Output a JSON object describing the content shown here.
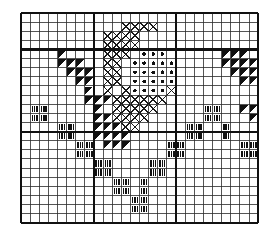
{
  "chart_data": {
    "type": "heatmap",
    "title": "",
    "subtitle": "",
    "xlabel": "",
    "ylabel": "",
    "grid": {
      "columns": 26,
      "rows": 23,
      "cell_size": 9.12,
      "origin_x": 21,
      "origin_y": 13,
      "line_color": "#2b2b2b",
      "line_width": 0.8,
      "heavy_line_width": 2.1,
      "heavy_line_color": "#111111",
      "heavy_columns": [
        0,
        8,
        17,
        26
      ],
      "heavy_rows": [
        0,
        4,
        13,
        23
      ],
      "grid_on": true
    },
    "legend_position": "none",
    "symbols": [
      {
        "key": "triangle",
        "name": "filled-triangle",
        "color": "#111111",
        "label": "half-stitch (solid)"
      },
      {
        "key": "dot",
        "name": "filled-dot",
        "color": "#111111",
        "label": "french knot / bead"
      },
      {
        "key": "cross",
        "name": "cross-stitch-x",
        "color": "#1a1a1a",
        "label": "cross stitch"
      },
      {
        "key": "bars",
        "name": "triple-vertical-bars",
        "color": "#111111",
        "label": "straight stitch"
      }
    ],
    "categories": [
      "c0",
      "c1",
      "c2",
      "c3",
      "c4",
      "c5",
      "c6",
      "c7",
      "c8",
      "c9",
      "c10",
      "c11",
      "c12",
      "c13",
      "c14",
      "c15",
      "c16",
      "c17",
      "c18",
      "c19",
      "c20",
      "c21",
      "c22",
      "c23",
      "c24",
      "c25"
    ],
    "row_labels": [
      "r0",
      "r1",
      "r2",
      "r3",
      "r4",
      "r5",
      "r6",
      "r7",
      "r8",
      "r9",
      "r10",
      "r11",
      "r12",
      "r13",
      "r14",
      "r15",
      "r16",
      "r17",
      "r18",
      "r19",
      "r20",
      "r21",
      "r22"
    ],
    "cells": [
      {
        "col": 11,
        "row": 1,
        "sym": "cross"
      },
      {
        "col": 12,
        "row": 1,
        "sym": "cross"
      },
      {
        "col": 13,
        "row": 1,
        "sym": "cross"
      },
      {
        "col": 14,
        "row": 1,
        "sym": "cross"
      },
      {
        "col": 9,
        "row": 2,
        "sym": "cross"
      },
      {
        "col": 10,
        "row": 2,
        "sym": "cross"
      },
      {
        "col": 11,
        "row": 2,
        "sym": "cross"
      },
      {
        "col": 12,
        "row": 2,
        "sym": "cross"
      },
      {
        "col": 9,
        "row": 3,
        "sym": "cross"
      },
      {
        "col": 10,
        "row": 3,
        "sym": "cross"
      },
      {
        "col": 11,
        "row": 3,
        "sym": "cross"
      },
      {
        "col": 12,
        "row": 3,
        "sym": "cross"
      },
      {
        "col": 4,
        "row": 4,
        "sym": "triangle"
      },
      {
        "col": 9,
        "row": 4,
        "sym": "cross"
      },
      {
        "col": 10,
        "row": 4,
        "sym": "cross"
      },
      {
        "col": 11,
        "row": 4,
        "sym": "cross"
      },
      {
        "col": 13,
        "row": 4,
        "sym": "dot"
      },
      {
        "col": 14,
        "row": 4,
        "sym": "dot"
      },
      {
        "col": 15,
        "row": 4,
        "sym": "dot"
      },
      {
        "col": 22,
        "row": 4,
        "sym": "triangle"
      },
      {
        "col": 23,
        "row": 4,
        "sym": "triangle"
      },
      {
        "col": 24,
        "row": 4,
        "sym": "triangle"
      },
      {
        "col": 4,
        "row": 5,
        "sym": "triangle"
      },
      {
        "col": 5,
        "row": 5,
        "sym": "triangle"
      },
      {
        "col": 6,
        "row": 5,
        "sym": "triangle"
      },
      {
        "col": 9,
        "row": 5,
        "sym": "cross"
      },
      {
        "col": 10,
        "row": 5,
        "sym": "cross"
      },
      {
        "col": 12,
        "row": 5,
        "sym": "dot"
      },
      {
        "col": 13,
        "row": 5,
        "sym": "dot"
      },
      {
        "col": 14,
        "row": 5,
        "sym": "dot"
      },
      {
        "col": 15,
        "row": 5,
        "sym": "dot"
      },
      {
        "col": 16,
        "row": 5,
        "sym": "dot"
      },
      {
        "col": 22,
        "row": 5,
        "sym": "triangle"
      },
      {
        "col": 23,
        "row": 5,
        "sym": "triangle"
      },
      {
        "col": 24,
        "row": 5,
        "sym": "triangle"
      },
      {
        "col": 25,
        "row": 5,
        "sym": "triangle"
      },
      {
        "col": 5,
        "row": 6,
        "sym": "triangle"
      },
      {
        "col": 6,
        "row": 6,
        "sym": "triangle"
      },
      {
        "col": 7,
        "row": 6,
        "sym": "triangle"
      },
      {
        "col": 9,
        "row": 6,
        "sym": "cross"
      },
      {
        "col": 10,
        "row": 6,
        "sym": "cross"
      },
      {
        "col": 12,
        "row": 6,
        "sym": "dot"
      },
      {
        "col": 13,
        "row": 6,
        "sym": "dot"
      },
      {
        "col": 14,
        "row": 6,
        "sym": "dot"
      },
      {
        "col": 15,
        "row": 6,
        "sym": "dot"
      },
      {
        "col": 16,
        "row": 6,
        "sym": "dot"
      },
      {
        "col": 23,
        "row": 6,
        "sym": "triangle"
      },
      {
        "col": 24,
        "row": 6,
        "sym": "triangle"
      },
      {
        "col": 25,
        "row": 6,
        "sym": "triangle"
      },
      {
        "col": 6,
        "row": 7,
        "sym": "triangle"
      },
      {
        "col": 7,
        "row": 7,
        "sym": "triangle"
      },
      {
        "col": 9,
        "row": 7,
        "sym": "cross"
      },
      {
        "col": 10,
        "row": 7,
        "sym": "cross"
      },
      {
        "col": 12,
        "row": 7,
        "sym": "dot"
      },
      {
        "col": 13,
        "row": 7,
        "sym": "dot"
      },
      {
        "col": 14,
        "row": 7,
        "sym": "dot"
      },
      {
        "col": 15,
        "row": 7,
        "sym": "dot"
      },
      {
        "col": 16,
        "row": 7,
        "sym": "dot"
      },
      {
        "col": 24,
        "row": 7,
        "sym": "triangle"
      },
      {
        "col": 25,
        "row": 7,
        "sym": "triangle"
      },
      {
        "col": 7,
        "row": 8,
        "sym": "triangle"
      },
      {
        "col": 9,
        "row": 8,
        "sym": "cross"
      },
      {
        "col": 11,
        "row": 8,
        "sym": "cross"
      },
      {
        "col": 12,
        "row": 8,
        "sym": "dot"
      },
      {
        "col": 13,
        "row": 8,
        "sym": "dot"
      },
      {
        "col": 14,
        "row": 8,
        "sym": "dot"
      },
      {
        "col": 15,
        "row": 8,
        "sym": "dot"
      },
      {
        "col": 16,
        "row": 8,
        "sym": "cross"
      },
      {
        "col": 7,
        "row": 9,
        "sym": "triangle"
      },
      {
        "col": 8,
        "row": 9,
        "sym": "triangle"
      },
      {
        "col": 9,
        "row": 9,
        "sym": "triangle"
      },
      {
        "col": 10,
        "row": 9,
        "sym": "cross"
      },
      {
        "col": 11,
        "row": 9,
        "sym": "cross"
      },
      {
        "col": 12,
        "row": 9,
        "sym": "cross"
      },
      {
        "col": 13,
        "row": 9,
        "sym": "cross"
      },
      {
        "col": 14,
        "row": 9,
        "sym": "cross"
      },
      {
        "col": 15,
        "row": 9,
        "sym": "cross"
      },
      {
        "col": 1,
        "row": 10,
        "sym": "bars"
      },
      {
        "col": 2,
        "row": 10,
        "sym": "bars"
      },
      {
        "col": 8,
        "row": 10,
        "sym": "triangle"
      },
      {
        "col": 10,
        "row": 10,
        "sym": "cross"
      },
      {
        "col": 11,
        "row": 10,
        "sym": "cross"
      },
      {
        "col": 12,
        "row": 10,
        "sym": "cross"
      },
      {
        "col": 13,
        "row": 10,
        "sym": "cross"
      },
      {
        "col": 14,
        "row": 10,
        "sym": "cross"
      },
      {
        "col": 20,
        "row": 10,
        "sym": "bars"
      },
      {
        "col": 21,
        "row": 10,
        "sym": "bars"
      },
      {
        "col": 24,
        "row": 10,
        "sym": "triangle"
      },
      {
        "col": 25,
        "row": 10,
        "sym": "triangle"
      },
      {
        "col": 1,
        "row": 11,
        "sym": "bars"
      },
      {
        "col": 2,
        "row": 11,
        "sym": "bars"
      },
      {
        "col": 8,
        "row": 11,
        "sym": "triangle"
      },
      {
        "col": 9,
        "row": 11,
        "sym": "triangle"
      },
      {
        "col": 10,
        "row": 11,
        "sym": "cross"
      },
      {
        "col": 11,
        "row": 11,
        "sym": "cross"
      },
      {
        "col": 12,
        "row": 11,
        "sym": "cross"
      },
      {
        "col": 13,
        "row": 11,
        "sym": "cross"
      },
      {
        "col": 20,
        "row": 11,
        "sym": "bars"
      },
      {
        "col": 21,
        "row": 11,
        "sym": "bars"
      },
      {
        "col": 25,
        "row": 11,
        "sym": "triangle"
      },
      {
        "col": 4,
        "row": 12,
        "sym": "bars"
      },
      {
        "col": 5,
        "row": 12,
        "sym": "bars"
      },
      {
        "col": 8,
        "row": 12,
        "sym": "triangle"
      },
      {
        "col": 9,
        "row": 12,
        "sym": "triangle"
      },
      {
        "col": 10,
        "row": 12,
        "sym": "triangle"
      },
      {
        "col": 11,
        "row": 12,
        "sym": "cross"
      },
      {
        "col": 12,
        "row": 12,
        "sym": "cross"
      },
      {
        "col": 18,
        "row": 12,
        "sym": "bars"
      },
      {
        "col": 19,
        "row": 12,
        "sym": "bars"
      },
      {
        "col": 22,
        "row": 12,
        "sym": "bars"
      },
      {
        "col": 4,
        "row": 13,
        "sym": "bars"
      },
      {
        "col": 5,
        "row": 13,
        "sym": "bars"
      },
      {
        "col": 8,
        "row": 13,
        "sym": "triangle"
      },
      {
        "col": 9,
        "row": 13,
        "sym": "triangle"
      },
      {
        "col": 10,
        "row": 13,
        "sym": "triangle"
      },
      {
        "col": 11,
        "row": 13,
        "sym": "triangle"
      },
      {
        "col": 18,
        "row": 13,
        "sym": "bars"
      },
      {
        "col": 19,
        "row": 13,
        "sym": "bars"
      },
      {
        "col": 22,
        "row": 13,
        "sym": "bars"
      },
      {
        "col": 6,
        "row": 14,
        "sym": "bars"
      },
      {
        "col": 7,
        "row": 14,
        "sym": "bars"
      },
      {
        "col": 9,
        "row": 14,
        "sym": "triangle"
      },
      {
        "col": 10,
        "row": 14,
        "sym": "triangle"
      },
      {
        "col": 11,
        "row": 14,
        "sym": "triangle"
      },
      {
        "col": 16,
        "row": 14,
        "sym": "bars"
      },
      {
        "col": 17,
        "row": 14,
        "sym": "bars"
      },
      {
        "col": 24,
        "row": 14,
        "sym": "bars"
      },
      {
        "col": 25,
        "row": 14,
        "sym": "bars"
      },
      {
        "col": 6,
        "row": 15,
        "sym": "bars"
      },
      {
        "col": 7,
        "row": 15,
        "sym": "bars"
      },
      {
        "col": 16,
        "row": 15,
        "sym": "bars"
      },
      {
        "col": 17,
        "row": 15,
        "sym": "bars"
      },
      {
        "col": 24,
        "row": 15,
        "sym": "bars"
      },
      {
        "col": 25,
        "row": 15,
        "sym": "bars"
      },
      {
        "col": 8,
        "row": 16,
        "sym": "bars"
      },
      {
        "col": 9,
        "row": 16,
        "sym": "bars"
      },
      {
        "col": 14,
        "row": 16,
        "sym": "bars"
      },
      {
        "col": 15,
        "row": 16,
        "sym": "bars"
      },
      {
        "col": 8,
        "row": 17,
        "sym": "bars"
      },
      {
        "col": 9,
        "row": 17,
        "sym": "bars"
      },
      {
        "col": 14,
        "row": 17,
        "sym": "bars"
      },
      {
        "col": 15,
        "row": 17,
        "sym": "bars"
      },
      {
        "col": 10,
        "row": 18,
        "sym": "bars"
      },
      {
        "col": 11,
        "row": 18,
        "sym": "bars"
      },
      {
        "col": 13,
        "row": 18,
        "sym": "bars"
      },
      {
        "col": 10,
        "row": 19,
        "sym": "bars"
      },
      {
        "col": 11,
        "row": 19,
        "sym": "bars"
      },
      {
        "col": 13,
        "row": 19,
        "sym": "bars"
      },
      {
        "col": 12,
        "row": 20,
        "sym": "bars"
      },
      {
        "col": 13,
        "row": 20,
        "sym": "bars"
      },
      {
        "col": 12,
        "row": 21,
        "sym": "bars"
      },
      {
        "col": 13,
        "row": 21,
        "sym": "bars"
      }
    ]
  }
}
